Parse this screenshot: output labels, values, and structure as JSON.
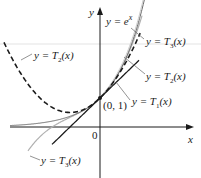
{
  "diagram": {
    "type": "function-graph",
    "axes": {
      "x_label": "x",
      "y_label": "y",
      "origin_label": "0"
    },
    "point": {
      "label": "(0, 1)",
      "x": 0,
      "y": 1
    },
    "curves": [
      {
        "name": "exp",
        "label": "y = e^x",
        "style": "solid-black-thin-double"
      },
      {
        "name": "T1",
        "label": "y = T1(x)",
        "style": "solid-black"
      },
      {
        "name": "T2",
        "label": "y = T2(x)",
        "style": "dashed-black"
      },
      {
        "name": "T3",
        "label": "y = T3(x)",
        "style": "solid-gray"
      }
    ],
    "labels": {
      "y_axis": "y",
      "x_axis": "x",
      "origin": "0",
      "point": "(0, 1)",
      "exp_prefix": "y = e",
      "exp_sup": "x",
      "t3_top_prefix": "y = T",
      "t3_top_sub": "3",
      "t2_right_prefix": "y = T",
      "t2_right_sub": "2",
      "t1_prefix": "y = T",
      "t1_sub": "1",
      "t2_left_prefix": "y = T",
      "t2_left_sub": "2",
      "t3_bottom_prefix": "y = T",
      "t3_bottom_sub": "3",
      "arg": "(x)"
    },
    "colors": {
      "axis": "#1a1a1a",
      "exp": "#555555",
      "t1": "#1a1a1a",
      "t2": "#1a1a1a",
      "t3": "#b0b0b0",
      "guide": "#d8d8d8"
    }
  }
}
